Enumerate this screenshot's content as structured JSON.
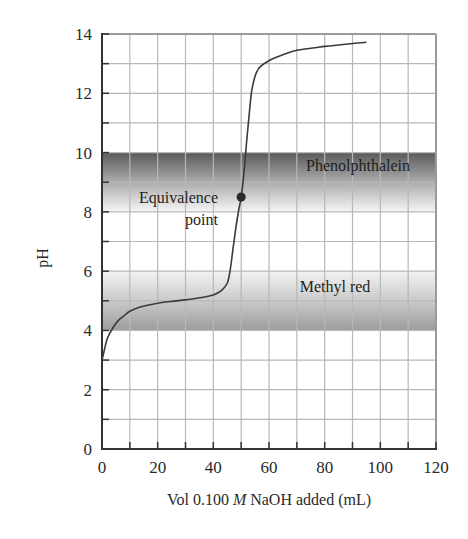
{
  "chart_data": {
    "type": "line",
    "title": "",
    "xlabel": "Vol 0.100 M NaOH added (mL)",
    "xlabel_parts": {
      "pre": "Vol 0.100 ",
      "italic": "M",
      "post": " NaOH added (mL)"
    },
    "ylabel": "pH",
    "xlim": [
      0,
      120
    ],
    "ylim": [
      0,
      14
    ],
    "x_ticks": [
      0,
      20,
      40,
      60,
      80,
      100,
      120
    ],
    "x_minor_step": 10,
    "y_ticks": [
      0,
      2,
      4,
      6,
      8,
      10,
      12,
      14
    ],
    "y_minor_step": 1,
    "grid": true,
    "series": [
      {
        "name": "Titration curve",
        "x": [
          0,
          1,
          2,
          4,
          6,
          8,
          10,
          14,
          20,
          25,
          30,
          35,
          40,
          43,
          45,
          46,
          47,
          48,
          49,
          50,
          51,
          52,
          53,
          54,
          56,
          60,
          65,
          70,
          80,
          90,
          95
        ],
        "y": [
          3.0,
          3.4,
          3.75,
          4.1,
          4.35,
          4.5,
          4.65,
          4.8,
          4.92,
          4.98,
          5.03,
          5.1,
          5.2,
          5.35,
          5.6,
          6.0,
          6.7,
          7.4,
          8.0,
          8.5,
          9.3,
          10.4,
          11.4,
          12.2,
          12.8,
          13.1,
          13.3,
          13.45,
          13.58,
          13.68,
          13.72
        ]
      }
    ],
    "bands": [
      {
        "name": "Phenolphthalein",
        "ymin": 8,
        "ymax": 10,
        "gradient": "dark-top"
      },
      {
        "name": "Methyl red",
        "ymin": 4,
        "ymax": 6,
        "gradient": "dark-bottom"
      }
    ],
    "annotations": [
      {
        "text_lines": [
          "Equivalence",
          "point"
        ],
        "x": 50,
        "y": 8.5,
        "marker": "filled-circle"
      }
    ],
    "legend": null
  },
  "colors": {
    "curve": "#3a3a3a",
    "grid": "#b8b8b8",
    "axis": "#333333",
    "frame_light": "#9a9a9a",
    "band_dark": "#5c5c5c",
    "band_mid": "#a8a8a8",
    "band_light": "#f2f2f2",
    "marker": "#2b2b2b"
  }
}
